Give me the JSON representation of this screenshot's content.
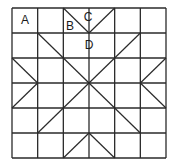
{
  "diagram": {
    "type": "quilt-block-grid",
    "grid": {
      "cols": 6,
      "rows": 6,
      "x0": 12,
      "y0": 8,
      "x1": 166,
      "y1": 158,
      "line_color": "#2a2a2a"
    },
    "labels": [
      {
        "text": "A",
        "x": 25,
        "y": 20
      },
      {
        "text": "B",
        "x": 70,
        "y": 26
      },
      {
        "text": "C",
        "x": 88,
        "y": 17
      },
      {
        "text": "D",
        "x": 89,
        "y": 45
      }
    ],
    "diagonals": [
      {
        "from": [
          0,
          0
        ],
        "to": [
          0,
          0
        ],
        "note": "cell coords in grid units"
      },
      {
        "from": [
          2,
          0
        ],
        "to": [
          3,
          1
        ]
      },
      {
        "from": [
          3,
          1
        ],
        "to": [
          4,
          0
        ]
      },
      {
        "from": [
          1,
          1
        ],
        "to": [
          2,
          2
        ]
      },
      {
        "from": [
          5,
          1
        ],
        "to": [
          4,
          2
        ]
      },
      {
        "from": [
          2,
          2
        ],
        "to": [
          4,
          4
        ]
      },
      {
        "from": [
          4,
          2
        ],
        "to": [
          2,
          4
        ]
      },
      {
        "from": [
          0,
          2
        ],
        "to": [
          1,
          3
        ]
      },
      {
        "from": [
          1,
          3
        ],
        "to": [
          0,
          4
        ]
      },
      {
        "from": [
          6,
          2
        ],
        "to": [
          5,
          3
        ]
      },
      {
        "from": [
          5,
          3
        ],
        "to": [
          6,
          4
        ]
      },
      {
        "from": [
          2,
          4
        ],
        "to": [
          1,
          5
        ]
      },
      {
        "from": [
          4,
          4
        ],
        "to": [
          5,
          5
        ]
      },
      {
        "from": [
          2,
          6
        ],
        "to": [
          3,
          5
        ]
      },
      {
        "from": [
          3,
          5
        ],
        "to": [
          4,
          6
        ]
      }
    ]
  }
}
